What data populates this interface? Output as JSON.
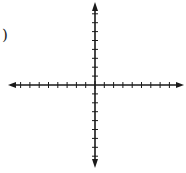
{
  "diagram": {
    "type": "coordinate-plane",
    "label_fragment": ")",
    "origin": {
      "x": 95,
      "y": 85
    },
    "x_axis": {
      "left_end": 8,
      "right_end": 184,
      "ticks_negative": 8,
      "ticks_positive": 8,
      "tick_spacing": 9.3
    },
    "y_axis": {
      "top_end": 2,
      "bottom_end": 168,
      "ticks_positive": 8,
      "ticks_negative": 8,
      "tick_spacing": 8.9
    },
    "colors": {
      "axis": "#1a1a1a",
      "background": "#ffffff"
    }
  }
}
